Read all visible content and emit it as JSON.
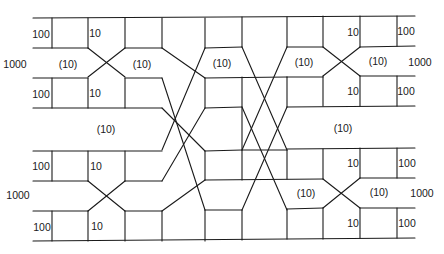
{
  "diagram": {
    "type": "network-flow-diagram",
    "labels": [
      {
        "id": "l1",
        "text": "100",
        "x": 41,
        "y": 34
      },
      {
        "id": "l2",
        "text": "10",
        "x": 95,
        "y": 33
      },
      {
        "id": "l3",
        "text": "1000",
        "x": 15,
        "y": 64
      },
      {
        "id": "l4",
        "text": "(10)",
        "x": 68,
        "y": 64
      },
      {
        "id": "l5",
        "text": "(10)",
        "x": 142,
        "y": 64
      },
      {
        "id": "l6",
        "text": "(10)",
        "x": 222,
        "y": 63
      },
      {
        "id": "l7",
        "text": "(10)",
        "x": 304,
        "y": 62
      },
      {
        "id": "l8",
        "text": "10",
        "x": 353,
        "y": 32
      },
      {
        "id": "l9",
        "text": "100",
        "x": 406,
        "y": 31
      },
      {
        "id": "l10",
        "text": "(10)",
        "x": 378,
        "y": 61
      },
      {
        "id": "l11",
        "text": "1000",
        "x": 420,
        "y": 62
      },
      {
        "id": "l12",
        "text": "100",
        "x": 41,
        "y": 94
      },
      {
        "id": "l13",
        "text": "10",
        "x": 95,
        "y": 93
      },
      {
        "id": "l14",
        "text": "10",
        "x": 353,
        "y": 91
      },
      {
        "id": "l15",
        "text": "100",
        "x": 406,
        "y": 91
      },
      {
        "id": "l16",
        "text": "(10)",
        "x": 106,
        "y": 129
      },
      {
        "id": "l17",
        "text": "(10)",
        "x": 343,
        "y": 128
      },
      {
        "id": "l18",
        "text": "100",
        "x": 41,
        "y": 166
      },
      {
        "id": "l19",
        "text": "10",
        "x": 96,
        "y": 166
      },
      {
        "id": "l20",
        "text": "10",
        "x": 353,
        "y": 163
      },
      {
        "id": "l21",
        "text": "100",
        "x": 407,
        "y": 163
      },
      {
        "id": "l22",
        "text": "1000",
        "x": 18,
        "y": 195
      },
      {
        "id": "l23",
        "text": "(10)",
        "x": 306,
        "y": 193
      },
      {
        "id": "l24",
        "text": "(10)",
        "x": 379,
        "y": 192
      },
      {
        "id": "l25",
        "text": "1000",
        "x": 422,
        "y": 193
      },
      {
        "id": "l26",
        "text": "100",
        "x": 42,
        "y": 227
      },
      {
        "id": "l27",
        "text": "10",
        "x": 97,
        "y": 226
      },
      {
        "id": "l28",
        "text": "10",
        "x": 353,
        "y": 223
      },
      {
        "id": "l29",
        "text": "100",
        "x": 407,
        "y": 223
      }
    ],
    "line_color": "#1a1a1a",
    "background": "#ffffff"
  }
}
